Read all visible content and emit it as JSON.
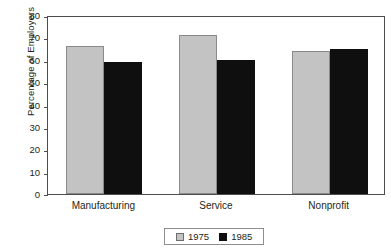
{
  "chart_data": {
    "type": "bar",
    "title": "",
    "xlabel": "",
    "ylabel": "Percentage of Employers",
    "categories": [
      "Manufacturing",
      "Service",
      "Nonprofit"
    ],
    "series": [
      {
        "name": "1975",
        "color": "#c3c3c3",
        "values": [
          66,
          71,
          64
        ]
      },
      {
        "name": "1985",
        "color": "#100f10",
        "values": [
          59,
          60,
          65
        ]
      }
    ],
    "ylim": [
      0,
      80
    ],
    "yticks": [
      0,
      10,
      20,
      30,
      40,
      50,
      60,
      70,
      80
    ],
    "ytick_labels": [
      "0",
      "10",
      "20",
      "30",
      "40",
      "50",
      "60",
      "70",
      "80"
    ],
    "grid": false,
    "legend_position": "bottom-center",
    "frame_color": "#4d4d4d",
    "background": "#ffffff"
  }
}
